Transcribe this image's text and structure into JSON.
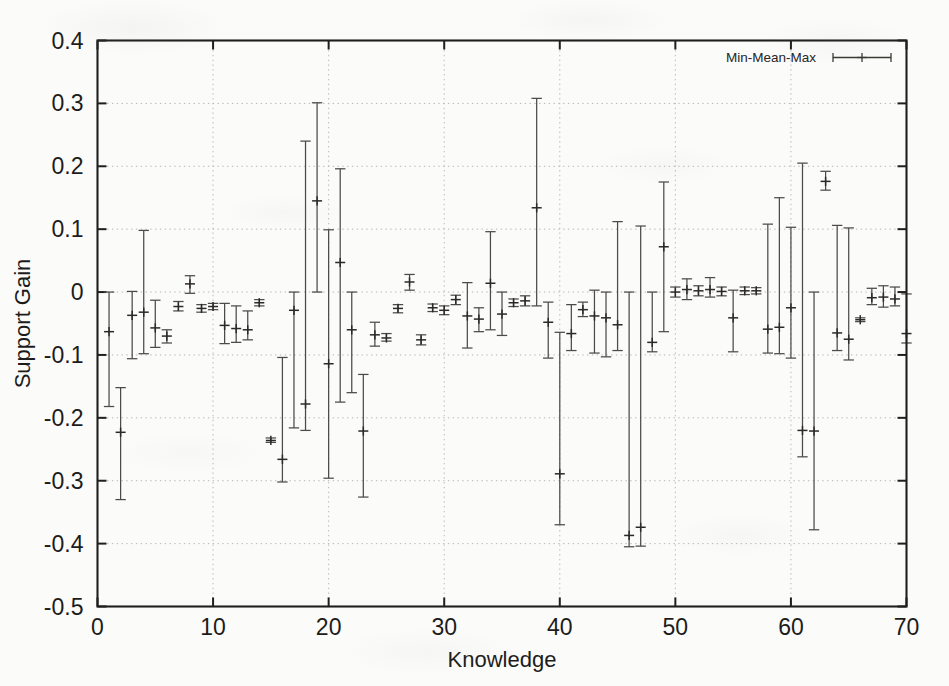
{
  "chart_data": {
    "type": "scatter",
    "title": "",
    "xlabel": "Knowledge",
    "ylabel": "Support Gain",
    "xlim": [
      0,
      70
    ],
    "ylim": [
      -0.5,
      0.4
    ],
    "xticks": [
      "0",
      "10",
      "20",
      "30",
      "40",
      "50",
      "60",
      "70"
    ],
    "xtick_values": [
      0,
      10,
      20,
      30,
      40,
      50,
      60,
      70
    ],
    "yticks": [
      "0.4",
      "0.3",
      "0.2",
      "0.1",
      "0",
      "-0.1",
      "-0.2",
      "-0.3",
      "-0.4",
      "-0.5"
    ],
    "ytick_values": [
      0.4,
      0.3,
      0.2,
      0.1,
      0,
      -0.1,
      -0.2,
      -0.3,
      -0.4,
      -0.5
    ],
    "grid": true,
    "legend": {
      "position": "top-right",
      "entries": [
        "Min-Mean-Max"
      ]
    },
    "series": [
      {
        "name": "Min-Mean-Max",
        "marker": "plus",
        "errorbar": "min-max",
        "points": [
          {
            "x": 1,
            "min": -0.182,
            "mean": -0.063,
            "max": 0.0
          },
          {
            "x": 2,
            "min": -0.33,
            "mean": -0.223,
            "max": -0.152
          },
          {
            "x": 3,
            "min": -0.106,
            "mean": -0.037,
            "max": 0.001
          },
          {
            "x": 4,
            "min": -0.098,
            "mean": -0.032,
            "max": 0.098
          },
          {
            "x": 5,
            "min": -0.088,
            "mean": -0.057,
            "max": -0.013
          },
          {
            "x": 6,
            "min": -0.081,
            "mean": -0.07,
            "max": -0.06
          },
          {
            "x": 7,
            "min": -0.03,
            "mean": -0.023,
            "max": -0.015
          },
          {
            "x": 8,
            "min": -0.002,
            "mean": 0.013,
            "max": 0.026
          },
          {
            "x": 9,
            "min": -0.032,
            "mean": -0.026,
            "max": -0.02
          },
          {
            "x": 10,
            "min": -0.028,
            "mean": -0.023,
            "max": -0.018
          },
          {
            "x": 11,
            "min": -0.082,
            "mean": -0.053,
            "max": -0.018
          },
          {
            "x": 12,
            "min": -0.08,
            "mean": -0.058,
            "max": -0.022
          },
          {
            "x": 13,
            "min": -0.076,
            "mean": -0.06,
            "max": -0.03
          },
          {
            "x": 14,
            "min": -0.022,
            "mean": -0.017,
            "max": -0.012
          },
          {
            "x": 15,
            "min": -0.239,
            "mean": -0.236,
            "max": -0.232
          },
          {
            "x": 16,
            "min": -0.302,
            "mean": -0.266,
            "max": -0.104
          },
          {
            "x": 17,
            "min": -0.216,
            "mean": -0.029,
            "max": 0.0
          },
          {
            "x": 18,
            "min": -0.22,
            "mean": -0.178,
            "max": 0.24
          },
          {
            "x": 19,
            "min": 0.0,
            "mean": 0.145,
            "max": 0.301
          },
          {
            "x": 20,
            "min": -0.296,
            "mean": -0.114,
            "max": 0.099
          },
          {
            "x": 21,
            "min": -0.175,
            "mean": 0.047,
            "max": 0.196
          },
          {
            "x": 22,
            "min": -0.16,
            "mean": -0.06,
            "max": 0.0
          },
          {
            "x": 23,
            "min": -0.326,
            "mean": -0.221,
            "max": -0.131
          },
          {
            "x": 24,
            "min": -0.086,
            "mean": -0.068,
            "max": -0.048
          },
          {
            "x": 25,
            "min": -0.078,
            "mean": -0.073,
            "max": -0.066
          },
          {
            "x": 26,
            "min": -0.033,
            "mean": -0.026,
            "max": -0.02
          },
          {
            "x": 27,
            "min": 0.003,
            "mean": 0.016,
            "max": 0.028
          },
          {
            "x": 28,
            "min": -0.084,
            "mean": -0.076,
            "max": -0.068
          },
          {
            "x": 29,
            "min": -0.031,
            "mean": -0.025,
            "max": -0.019
          },
          {
            "x": 30,
            "min": -0.036,
            "mean": -0.029,
            "max": -0.022
          },
          {
            "x": 31,
            "min": -0.02,
            "mean": -0.012,
            "max": -0.005
          },
          {
            "x": 32,
            "min": -0.089,
            "mean": -0.038,
            "max": 0.015
          },
          {
            "x": 33,
            "min": -0.063,
            "mean": -0.043,
            "max": -0.025
          },
          {
            "x": 34,
            "min": -0.06,
            "mean": 0.014,
            "max": 0.096
          },
          {
            "x": 35,
            "min": -0.069,
            "mean": -0.035,
            "max": 0.0
          },
          {
            "x": 36,
            "min": -0.023,
            "mean": -0.017,
            "max": -0.011
          },
          {
            "x": 37,
            "min": -0.022,
            "mean": -0.014,
            "max": -0.006
          },
          {
            "x": 38,
            "min": -0.022,
            "mean": 0.134,
            "max": 0.308
          },
          {
            "x": 39,
            "min": -0.105,
            "mean": -0.048,
            "max": -0.016
          },
          {
            "x": 40,
            "min": -0.37,
            "mean": -0.289,
            "max": -0.064
          },
          {
            "x": 41,
            "min": -0.093,
            "mean": -0.066,
            "max": -0.02
          },
          {
            "x": 42,
            "min": -0.039,
            "mean": -0.028,
            "max": -0.016
          },
          {
            "x": 43,
            "min": -0.097,
            "mean": -0.038,
            "max": 0.003
          },
          {
            "x": 44,
            "min": -0.103,
            "mean": -0.041,
            "max": 0.0
          },
          {
            "x": 45,
            "min": -0.093,
            "mean": -0.052,
            "max": 0.112
          },
          {
            "x": 46,
            "min": -0.405,
            "mean": -0.387,
            "max": 0.0
          },
          {
            "x": 47,
            "min": -0.404,
            "mean": -0.374,
            "max": 0.105
          },
          {
            "x": 48,
            "min": -0.095,
            "mean": -0.08,
            "max": 0.0
          },
          {
            "x": 49,
            "min": -0.063,
            "mean": 0.072,
            "max": 0.175
          },
          {
            "x": 50,
            "min": -0.008,
            "mean": 0.0,
            "max": 0.008
          },
          {
            "x": 51,
            "min": -0.012,
            "mean": 0.004,
            "max": 0.021
          },
          {
            "x": 52,
            "min": -0.006,
            "mean": 0.002,
            "max": 0.01
          },
          {
            "x": 53,
            "min": -0.008,
            "mean": 0.004,
            "max": 0.023
          },
          {
            "x": 54,
            "min": -0.006,
            "mean": 0.001,
            "max": 0.008
          },
          {
            "x": 55,
            "min": -0.095,
            "mean": -0.041,
            "max": 0.003
          },
          {
            "x": 56,
            "min": -0.004,
            "mean": 0.002,
            "max": 0.008
          },
          {
            "x": 57,
            "min": -0.003,
            "mean": 0.002,
            "max": 0.007
          },
          {
            "x": 58,
            "min": -0.097,
            "mean": -0.059,
            "max": 0.108
          },
          {
            "x": 59,
            "min": -0.098,
            "mean": -0.056,
            "max": 0.15
          },
          {
            "x": 60,
            "min": -0.105,
            "mean": -0.025,
            "max": 0.103
          },
          {
            "x": 61,
            "min": -0.262,
            "mean": -0.22,
            "max": 0.205
          },
          {
            "x": 62,
            "min": -0.378,
            "mean": -0.221,
            "max": 0.0
          },
          {
            "x": 63,
            "min": 0.162,
            "mean": 0.176,
            "max": 0.192
          },
          {
            "x": 64,
            "min": -0.093,
            "mean": -0.065,
            "max": 0.106
          },
          {
            "x": 65,
            "min": -0.108,
            "mean": -0.075,
            "max": 0.102
          },
          {
            "x": 66,
            "min": -0.047,
            "mean": -0.044,
            "max": -0.041
          },
          {
            "x": 67,
            "min": -0.02,
            "mean": -0.009,
            "max": 0.006
          },
          {
            "x": 68,
            "min": -0.024,
            "mean": -0.008,
            "max": 0.01
          },
          {
            "x": 69,
            "min": -0.022,
            "mean": -0.011,
            "max": 0.008
          },
          {
            "x": 70,
            "min": -0.081,
            "mean": -0.066,
            "max": -0.003
          }
        ]
      }
    ]
  },
  "colors": {
    "background": "#fbfbfa",
    "axis": "#201f1d",
    "grid": "#b9b7b2",
    "data": "#4d4b47",
    "text": "#1d1c1a"
  }
}
